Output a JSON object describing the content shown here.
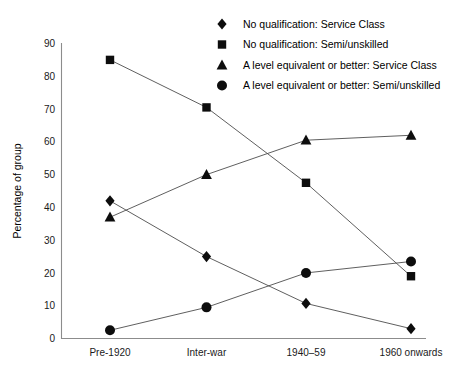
{
  "chart_data": {
    "type": "line",
    "title": "",
    "xlabel": "",
    "ylabel": "Percentage of group",
    "categories": [
      "Pre-1920",
      "Inter-war",
      "1940–59",
      "1960 onwards"
    ],
    "ylim": [
      0,
      90
    ],
    "yticks": [
      0,
      10,
      20,
      30,
      40,
      50,
      60,
      70,
      80,
      90
    ],
    "ytick_labels": [
      "0",
      "10",
      "20",
      "30",
      "40",
      "50",
      "60",
      "70",
      "80",
      "90"
    ],
    "grid": false,
    "legend_position": "top-right",
    "series": [
      {
        "name": "No qualification: Service Class",
        "marker": "diamond",
        "values": [
          42,
          25,
          10.7,
          3
        ]
      },
      {
        "name": "No qualification: Semi/unskilled",
        "marker": "square",
        "values": [
          85,
          70.5,
          47.5,
          19
        ]
      },
      {
        "name": "A level equivalent or better: Service Class",
        "marker": "triangle",
        "values": [
          37,
          50,
          60.5,
          62
        ]
      },
      {
        "name": "A level equivalent or better: Semi/unskilled",
        "marker": "circle",
        "values": [
          2.5,
          9.5,
          20,
          23.5
        ]
      }
    ]
  },
  "colors": {
    "marker": "#0d0d0d",
    "line": "#4d4d4d",
    "axis": "#8c8c8c",
    "text": "#000000",
    "background": "#ffffff"
  }
}
